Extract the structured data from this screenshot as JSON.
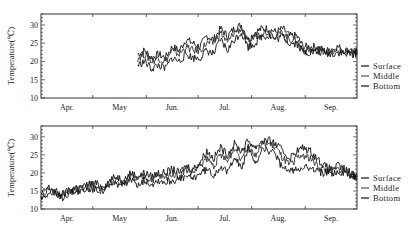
{
  "chart_data": [
    {
      "type": "line",
      "title": "",
      "panel": "top",
      "xlabel": "",
      "ylabel": "Temperature(℃)",
      "ylim": [
        10,
        33
      ],
      "yticks": [
        10,
        15,
        20,
        25,
        30
      ],
      "x_categories": [
        "Apr.",
        "May",
        "Jun.",
        "Jul.",
        "Aug.",
        "Sep."
      ],
      "grid": false,
      "legend": {
        "position": "right",
        "entries": [
          "Surface",
          "Middle",
          "Bottom"
        ]
      },
      "x_note": "day index 0 = Apr 1 (approx.), data begins ~late May",
      "series": [
        {
          "name": "Surface",
          "x": [
            56,
            60,
            64,
            68,
            72,
            76,
            80,
            84,
            88,
            92,
            96,
            100,
            104,
            108,
            112,
            116,
            120,
            124,
            128,
            132,
            136,
            140,
            144,
            148,
            152,
            156,
            160,
            164,
            168,
            172,
            176,
            180,
            183
          ],
          "values": [
            22,
            23,
            21,
            22,
            21,
            24,
            23,
            26,
            25,
            24,
            27,
            26,
            29,
            27,
            29,
            30,
            26,
            28,
            29,
            29,
            28,
            29,
            27,
            27,
            24,
            24,
            24,
            23,
            23,
            24,
            23,
            23,
            22.5
          ]
        },
        {
          "name": "Middle",
          "x": [
            56,
            60,
            64,
            68,
            72,
            76,
            80,
            84,
            88,
            92,
            96,
            100,
            104,
            108,
            112,
            116,
            120,
            124,
            128,
            132,
            136,
            140,
            144,
            148,
            152,
            156,
            160,
            164,
            168,
            172,
            176,
            180,
            183
          ],
          "values": [
            21,
            22,
            20,
            21,
            20,
            23,
            22,
            24,
            23,
            23,
            25,
            25,
            28,
            25,
            28,
            29,
            25,
            27,
            28,
            28,
            27,
            28,
            26,
            26,
            23,
            23,
            23,
            23,
            22.5,
            23,
            22.5,
            22.5,
            22
          ]
        },
        {
          "name": "Bottom",
          "x": [
            56,
            60,
            64,
            68,
            72,
            76,
            80,
            84,
            88,
            92,
            96,
            100,
            104,
            108,
            112,
            116,
            120,
            124,
            128,
            132,
            136,
            140,
            144,
            148,
            152,
            156,
            160,
            164,
            168,
            172,
            176,
            180,
            183
          ],
          "values": [
            19,
            20,
            18,
            19,
            18,
            21,
            20,
            22,
            21,
            21,
            23,
            22,
            26,
            23,
            26,
            28,
            24,
            25,
            27,
            27,
            26,
            27,
            25,
            25,
            22.5,
            22.5,
            22.5,
            22.5,
            22,
            22.5,
            22,
            22,
            22
          ]
        }
      ]
    },
    {
      "type": "line",
      "title": "",
      "panel": "bottom",
      "xlabel": "",
      "ylabel": "Temperature(℃)",
      "ylim": [
        10,
        33
      ],
      "yticks": [
        10,
        15,
        20,
        25,
        30
      ],
      "x_categories": [
        "Apr.",
        "May",
        "Jun.",
        "Jul.",
        "Aug.",
        "Sep."
      ],
      "grid": false,
      "legend": {
        "position": "right",
        "entries": [
          "Surface",
          "Middle",
          "Bottom"
        ]
      },
      "series": [
        {
          "name": "Surface",
          "x": [
            0,
            4,
            8,
            12,
            16,
            20,
            24,
            28,
            32,
            36,
            40,
            44,
            48,
            52,
            56,
            60,
            64,
            68,
            72,
            76,
            80,
            84,
            88,
            92,
            96,
            100,
            104,
            108,
            112,
            116,
            120,
            124,
            128,
            132,
            136,
            140,
            144,
            148,
            152,
            156,
            160,
            164,
            168,
            172,
            176,
            180,
            183
          ],
          "values": [
            14,
            16,
            15,
            14,
            15,
            16,
            16,
            17,
            17,
            16,
            18,
            19,
            18,
            20,
            19,
            20,
            19,
            20,
            20,
            21,
            20,
            22,
            21,
            23,
            26,
            24,
            27,
            25,
            28,
            26,
            29,
            27,
            29,
            29,
            28,
            26,
            24,
            26,
            27,
            26,
            24,
            22,
            21,
            22,
            21,
            20,
            19
          ]
        },
        {
          "name": "Middle",
          "x": [
            0,
            4,
            8,
            12,
            16,
            20,
            24,
            28,
            32,
            36,
            40,
            44,
            48,
            52,
            56,
            60,
            64,
            68,
            72,
            76,
            80,
            84,
            88,
            92,
            96,
            100,
            104,
            108,
            112,
            116,
            120,
            124,
            128,
            132,
            136,
            140,
            144,
            148,
            152,
            156,
            160,
            164,
            168,
            172,
            176,
            180,
            183
          ],
          "values": [
            13.5,
            15,
            14.5,
            13.5,
            15,
            15.5,
            15.5,
            16,
            16,
            15.5,
            17,
            18,
            17,
            19,
            18,
            19,
            18,
            19,
            18.5,
            20,
            19,
            21,
            20,
            22,
            24,
            22,
            25,
            23,
            27,
            24,
            28,
            25,
            28,
            28,
            27,
            24,
            22,
            24,
            25,
            24,
            22,
            21,
            20.5,
            21,
            20.5,
            19.5,
            19
          ]
        },
        {
          "name": "Bottom",
          "x": [
            0,
            4,
            8,
            12,
            16,
            20,
            24,
            28,
            32,
            36,
            40,
            44,
            48,
            52,
            56,
            60,
            64,
            68,
            72,
            76,
            80,
            84,
            88,
            92,
            96,
            100,
            104,
            108,
            112,
            116,
            120,
            124,
            128,
            132,
            136,
            140,
            144,
            148,
            152,
            156,
            160,
            164,
            168,
            172,
            176,
            180,
            183
          ],
          "values": [
            13,
            14.5,
            14,
            13,
            14.5,
            15,
            15,
            15.5,
            15.5,
            15,
            16.5,
            17,
            16.5,
            18,
            17,
            18,
            17,
            18,
            17.5,
            18,
            18,
            19,
            18.5,
            20,
            21,
            19.5,
            22,
            20,
            25,
            21,
            27,
            22,
            27,
            26,
            25,
            21,
            20.5,
            21,
            22,
            21,
            20.5,
            20,
            20,
            20,
            20,
            19,
            18.5
          ]
        }
      ]
    }
  ],
  "legend": {
    "top": {
      "items": [
        {
          "label": "Surface"
        },
        {
          "label": "Middle"
        },
        {
          "label": "Bottom"
        }
      ]
    },
    "bottom": {
      "items": [
        {
          "label": "Surface"
        },
        {
          "label": "Middle"
        },
        {
          "label": "Bottom"
        }
      ]
    }
  },
  "axes": {
    "ylabel": "Temperature(℃)",
    "yticks": [
      "10",
      "15",
      "20",
      "25",
      "30"
    ],
    "months": [
      "Apr.",
      "May",
      "Jun.",
      "Jul.",
      "Aug.",
      "Sep."
    ]
  },
  "colors": {
    "line": "#111111",
    "axis": "#333333"
  }
}
